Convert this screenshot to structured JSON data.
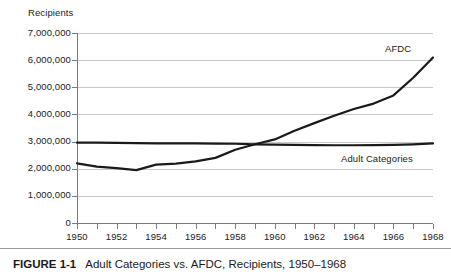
{
  "figure": {
    "number_label": "FIGURE 1-1",
    "caption": "Adult Categories vs. AFDC, Recipients, 1950–1968"
  },
  "chart_data": {
    "type": "line",
    "title": "",
    "xlabel": "",
    "ylabel": "Recipients",
    "y_axis_title": "Recipients",
    "x": [
      1950,
      1951,
      1952,
      1953,
      1954,
      1955,
      1956,
      1957,
      1958,
      1959,
      1960,
      1961,
      1962,
      1963,
      1964,
      1965,
      1966,
      1967,
      1968
    ],
    "xlim": [
      1950,
      1968
    ],
    "ylim": [
      0,
      7000000
    ],
    "ytick_values": [
      0,
      1000000,
      2000000,
      3000000,
      4000000,
      5000000,
      6000000,
      7000000
    ],
    "ytick_labels": [
      "0",
      "1,000,000",
      "2,000,000",
      "3,000,000",
      "4,000,000",
      "5,000,000",
      "6,000,000",
      "7,000,000"
    ],
    "xtick_values": [
      1950,
      1952,
      1954,
      1956,
      1958,
      1960,
      1962,
      1964,
      1966,
      1968
    ],
    "xtick_labels": [
      "1950",
      "1952",
      "1954",
      "1956",
      "1958",
      "1960",
      "1962",
      "1964",
      "1966",
      "1968"
    ],
    "minor_xticks_every": 1,
    "grid": "horizontal",
    "legend": "inline-labels",
    "series": [
      {
        "name": "AFDC",
        "label": "AFDC",
        "color": "#1a1a1a",
        "label_position": {
          "x": 385,
          "y": 43
        },
        "values": [
          2200000,
          2080000,
          2020000,
          1950000,
          2150000,
          2190000,
          2270000,
          2400000,
          2700000,
          2900000,
          3080000,
          3400000,
          3680000,
          3950000,
          4200000,
          4400000,
          4700000,
          5350000,
          6100000
        ]
      },
      {
        "name": "Adult Categories",
        "label": "Adult Categories",
        "color": "#1a1a1a",
        "label_position": {
          "x": 341,
          "y": 153
        },
        "values": [
          2960000,
          2960000,
          2950000,
          2940000,
          2930000,
          2930000,
          2930000,
          2925000,
          2920000,
          2900000,
          2890000,
          2880000,
          2870000,
          2865000,
          2865000,
          2870000,
          2880000,
          2900000,
          2930000
        ]
      }
    ],
    "colors": {
      "line": "#1a1a1a",
      "gridline": "#c9c9c9",
      "axis": "#7a7a7a",
      "background": "#ffffff",
      "text": "#1a1a1a"
    }
  }
}
